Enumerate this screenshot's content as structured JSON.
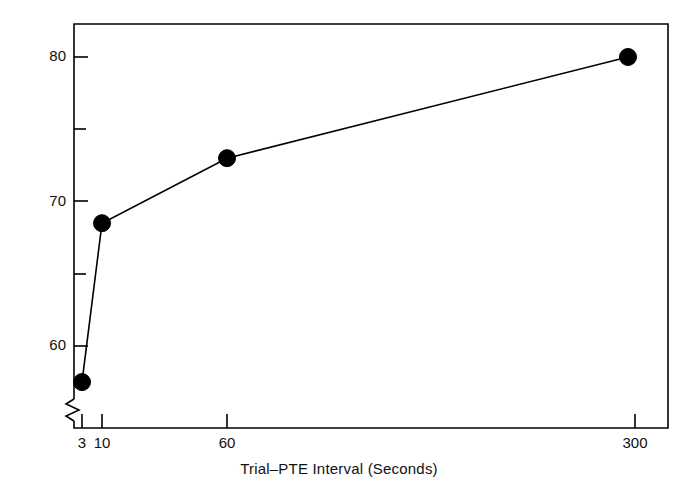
{
  "chart_data": {
    "type": "line",
    "title": "",
    "subtitle": "",
    "xlabel": "Trial–PTE  Interval (Seconds)",
    "ylabel": "Median Percentage CRs",
    "categories": [
      "3",
      "10",
      "60",
      "300"
    ],
    "x": [
      3,
      10,
      60,
      300
    ],
    "values": [
      57.5,
      68.5,
      73.0,
      80.0
    ],
    "series": [
      {
        "name": "Median Percentage CRs",
        "values": [
          57.5,
          68.5,
          73.0,
          80.0
        ],
        "marker": "filled-circle",
        "color": "#000000",
        "line_color": "#000000"
      }
    ],
    "x_tick_labels": [
      "3",
      "10",
      "60",
      "300"
    ],
    "x_tick_positions": [
      3,
      10,
      60,
      300
    ],
    "x_scale": "log-like-ordinal",
    "xlim": [
      2.4,
      380
    ],
    "y_tick_labels": [
      "60",
      "70",
      "80"
    ],
    "y_major_ticks": [
      60,
      70,
      80
    ],
    "y_minor_ticks": [
      65,
      75
    ],
    "ylim": [
      57.0,
      81.7
    ],
    "grid": false,
    "legend": "none",
    "axis_break": true,
    "annotations": []
  },
  "figure": {
    "background_color": "#ffffff",
    "frame_color": "#000000",
    "text_color": "#111111",
    "marker_color": "#000000",
    "line_color": "#000000"
  },
  "labels": {
    "y_title": "Median Percentage CRs",
    "x_title": "Trial–PTE  Interval (Seconds)",
    "y_ticks": [
      {
        "text": "80",
        "value": 80
      },
      {
        "text": "70",
        "value": 70
      },
      {
        "text": "60",
        "value": 60
      }
    ],
    "x_ticks": [
      {
        "text": "3",
        "value": 3
      },
      {
        "text": "10",
        "value": 10
      },
      {
        "text": "60",
        "value": 60
      },
      {
        "text": "300",
        "value": 300
      }
    ]
  }
}
